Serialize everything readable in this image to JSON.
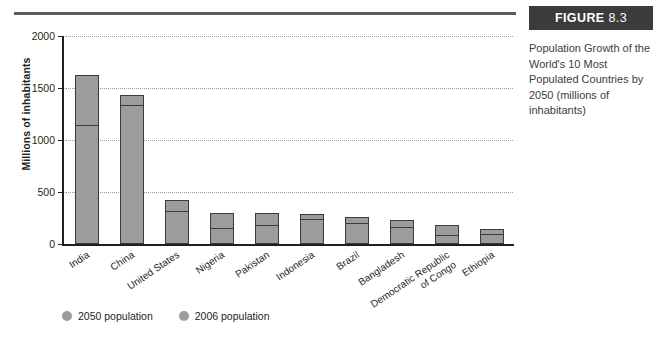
{
  "figure": {
    "label_word": "FIGURE",
    "number": "8.3",
    "caption": "Population Growth of the World's 10 Most Populated Countries by 2050 (millions of inhabitants)"
  },
  "colors": {
    "bar_fill": "#9c9c9c",
    "bar_outline": "#3b3b3b",
    "header_bg": "#3b3b3b",
    "rule": "#5b5b5b",
    "text": "#231f20"
  },
  "chart_data": {
    "type": "bar",
    "title": "Population Growth of the World's 10 Most Populated Countries by 2050 (millions of inhabitants)",
    "xlabel": "",
    "ylabel": "Millions of inhabitants",
    "ylim": [
      0,
      2000
    ],
    "yticks": [
      0,
      500,
      1000,
      1500,
      2000
    ],
    "ytick_labels": [
      "0",
      "500",
      "1000",
      "1500",
      "2000"
    ],
    "grid": true,
    "grid_style": "dotted-horizontal",
    "legend_position": "bottom-left",
    "categories": [
      "India",
      "China",
      "United States",
      "Nigeria",
      "Pakistan",
      "Indonesia",
      "Brazil",
      "Bangladesh",
      "Democratic Republic\nof Congo",
      "Ethiopia"
    ],
    "series": [
      {
        "name": "2050 population",
        "values": [
          1628,
          1437,
          420,
          299,
          295,
          285,
          260,
          231,
          187,
          145
        ]
      },
      {
        "name": "2006 population",
        "values": [
          1122,
          1320,
          300,
          135,
          166,
          225,
          187,
          147,
          63,
          75
        ]
      }
    ]
  },
  "legend": [
    {
      "label": "2050 population",
      "color": "#9c9c9c"
    },
    {
      "label": "2006 population",
      "color": "#9c9c9c"
    }
  ]
}
